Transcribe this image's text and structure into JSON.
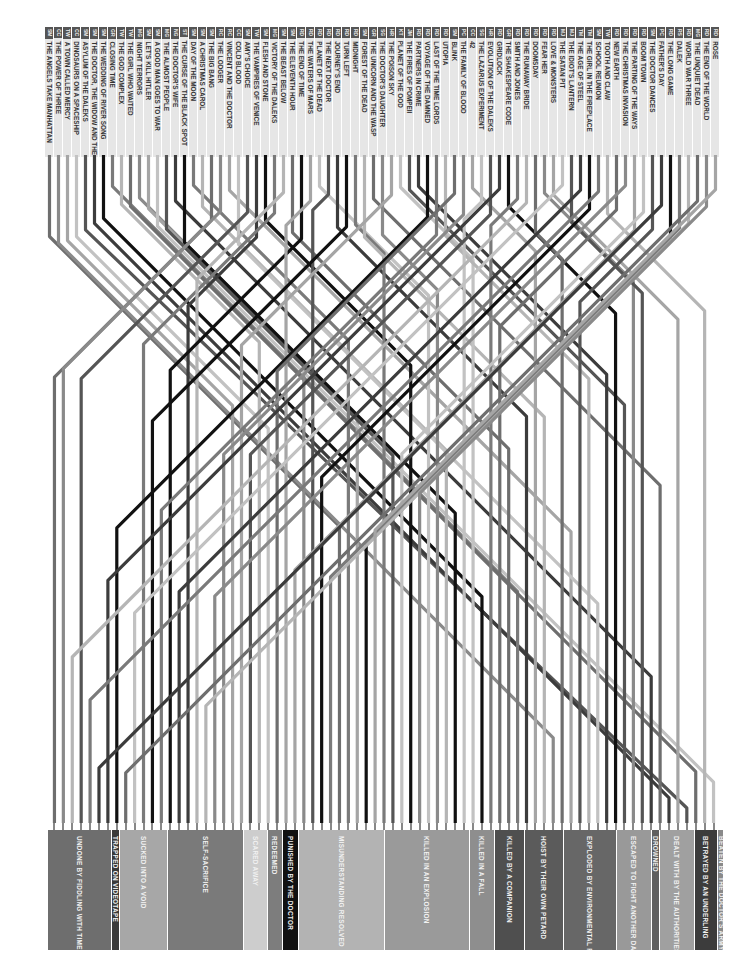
{
  "episodes": [
    {
      "code": "SM",
      "title": "THE ANGELS TAKE MANHATTAN"
    },
    {
      "code": "CC",
      "title": "THE POWER OF THREE"
    },
    {
      "code": "TW",
      "title": "A TOWN CALLED MERCY"
    },
    {
      "code": "CC",
      "title": "DINOSAURS ON A SPACESHIP"
    },
    {
      "code": "SM",
      "title": "ASYLUM OF THE DALEKS"
    },
    {
      "code": "SM",
      "title": "THE DOCTOR, THE WIDOW AND THE WARDROBE"
    },
    {
      "code": "SM",
      "title": "THE WEDDING OF RIVER SONG"
    },
    {
      "code": "GR",
      "title": "CLOSING TIME"
    },
    {
      "code": "TW",
      "title": "THE GOD COMPLEX"
    },
    {
      "code": "TW",
      "title": "THE GIRL WHO WAITED"
    },
    {
      "code": "MG",
      "title": "NIGHT TERRORS"
    },
    {
      "code": "SM",
      "title": "LET'S KILL HITLER"
    },
    {
      "code": "SM",
      "title": "A GOOD MAN GOES TO WAR"
    },
    {
      "code": "MG",
      "title": "THE ALMOST PEOPLE"
    },
    {
      "code": "NG",
      "title": "THE DOCTOR'S WIFE"
    },
    {
      "code": "ST",
      "title": "THE CURSE OF THE BLACK SPOT"
    },
    {
      "code": "SM",
      "title": "DAY OF THE MOON"
    },
    {
      "code": "SM",
      "title": "A CHRISTMAS CAROL"
    },
    {
      "code": "SM",
      "title": "THE BIG BANG"
    },
    {
      "code": "RC",
      "title": "THE LODGER"
    },
    {
      "code": "RC",
      "title": "VINCENT AND THE DOCTOR"
    },
    {
      "code": "CC",
      "title": "COLD BLOOD"
    },
    {
      "code": "SM",
      "title": "AMY'S CHOICE"
    },
    {
      "code": "TW",
      "title": "THE VAMPIRES OF VENICE"
    },
    {
      "code": "SM",
      "title": "FLESH AND STONE"
    },
    {
      "code": "MG",
      "title": "VICTORY OF THE DALEKS"
    },
    {
      "code": "SM",
      "title": "THE BEAST BELOW"
    },
    {
      "code": "SM",
      "title": "THE ELEVENTH HOUR"
    },
    {
      "code": "RD",
      "title": "THE END OF TIME"
    },
    {
      "code": "RD",
      "title": "THE WATERS OF MARS"
    },
    {
      "code": "RD",
      "title": "PLANET OF THE DEAD"
    },
    {
      "code": "RD",
      "title": "THE NEXT DOCTOR"
    },
    {
      "code": "RD",
      "title": "JOURNEY'S END"
    },
    {
      "code": "RD",
      "title": "TURN LEFT"
    },
    {
      "code": "RD",
      "title": "MIDNIGHT"
    },
    {
      "code": "SM",
      "title": "FOREST OF THE DEAD"
    },
    {
      "code": "GR",
      "title": "THE UNICORN AND THE WASP"
    },
    {
      "code": "SG",
      "title": "THE DOCTOR'S DAUGHTER"
    },
    {
      "code": "HR",
      "title": "THE POISON SKY"
    },
    {
      "code": "KT",
      "title": "PLANET OF THE OOD"
    },
    {
      "code": "JM",
      "title": "THE FIRES OF POMPEII"
    },
    {
      "code": "RD",
      "title": "PARTNERS IN CRIME"
    },
    {
      "code": "RD",
      "title": "VOYAGE OF THE DAMNED"
    },
    {
      "code": "RD",
      "title": "LAST OF THE TIME LORDS"
    },
    {
      "code": "RD",
      "title": "UTOPIA"
    },
    {
      "code": "SM",
      "title": "BLINK"
    },
    {
      "code": "PC",
      "title": "THE FAMILY OF BLOOD"
    },
    {
      "code": "CC",
      "title": "42"
    },
    {
      "code": "SG",
      "title": "THE LAZARUS EXPERIMENT"
    },
    {
      "code": "HR",
      "title": "EVOLUTION OF THE DALEKS"
    },
    {
      "code": "RD",
      "title": "GRIDLOCK"
    },
    {
      "code": "GR",
      "title": "THE SHAKESPEARE CODE"
    },
    {
      "code": "RD",
      "title": "SMITH AND JONES"
    },
    {
      "code": "RD",
      "title": "THE RUNAWAY BRIDE"
    },
    {
      "code": "RD",
      "title": "DOOMSDAY"
    },
    {
      "code": "RD",
      "title": "FEAR HER"
    },
    {
      "code": "RD",
      "title": "LOVE & MONSTERS"
    },
    {
      "code": "MJ",
      "title": "THE SATAN PIT"
    },
    {
      "code": "MJ",
      "title": "THE IDIOT'S LANTERN"
    },
    {
      "code": "TM",
      "title": "THE AGE OF STEEL"
    },
    {
      "code": "TM",
      "title": "THE GIRL IN THE FIREPLACE"
    },
    {
      "code": "SM",
      "title": "SCHOOL REUNION"
    },
    {
      "code": "TW",
      "title": "TOOTH AND CLAW"
    },
    {
      "code": "RD",
      "title": "NEW EARTH"
    },
    {
      "code": "RD",
      "title": "THE CHRISTMAS INVASION"
    },
    {
      "code": "RD",
      "title": "THE PARTING OF THE WAYS"
    },
    {
      "code": "RD",
      "title": "BOOM TOWN"
    },
    {
      "code": "SM",
      "title": "THE DOCTOR DANCES"
    },
    {
      "code": "PC",
      "title": "FATHER'S DAY"
    },
    {
      "code": "RD",
      "title": "THE LONG GAME"
    },
    {
      "code": "RS",
      "title": "DALEK"
    },
    {
      "code": "RD",
      "title": "WORLD WAR THREE"
    },
    {
      "code": "MG",
      "title": "THE UNQUIET DEAD"
    },
    {
      "code": "RD",
      "title": "THE END OF THE WORLD"
    },
    {
      "code": "RD",
      "title": "ROSE"
    }
  ],
  "categories": [
    {
      "label": "UNDONE BY FIDDLING WITH TIME",
      "x": 48,
      "w": 64,
      "color": "#6e6e6e"
    },
    {
      "label": "TRAPPED ON VIDEOTAPE",
      "x": 112,
      "w": 8,
      "color": "#3a3a3a"
    },
    {
      "label": "SUCKED INTO A VOID",
      "x": 120,
      "w": 48,
      "color": "#a7a7a7"
    },
    {
      "label": "SELF-SACRIFICE",
      "x": 168,
      "w": 76,
      "color": "#7a7a7a"
    },
    {
      "label": "SCARED AWAY",
      "x": 244,
      "w": 24,
      "color": "#cdcdcd"
    },
    {
      "label": "REDEEMED",
      "x": 268,
      "w": 15,
      "color": "#7d7d7d"
    },
    {
      "label": "PUNISHED BY THE DOCTOR",
      "x": 283,
      "w": 16,
      "color": "#111111"
    },
    {
      "label": "MISUNDERSTANDING RESOLVED",
      "x": 299,
      "w": 86,
      "color": "#b3b3b3"
    },
    {
      "label": "KILLED IN AN EXPLOSION",
      "x": 385,
      "w": 85,
      "color": "#9a9a9a"
    },
    {
      "label": "KILLED IN A FALL",
      "x": 470,
      "w": 25,
      "color": "#8e8e8e"
    },
    {
      "label": "KILLED BY A COMPANION",
      "x": 495,
      "w": 30,
      "color": "#4f4f4f"
    },
    {
      "label": "HOIST BY THEIR OWN PETARD",
      "x": 525,
      "w": 39,
      "color": "#5b5b5b"
    },
    {
      "label": "EXPLODED BY ENVIRONMENTAL FACTOR",
      "x": 564,
      "w": 53,
      "color": "#676767"
    },
    {
      "label": "ESCAPED TO FIGHT ANOTHER DAY",
      "x": 617,
      "w": 35,
      "color": "#999999"
    },
    {
      "label": "DROWNED",
      "x": 652,
      "w": 8,
      "color": "#5f5f5f"
    },
    {
      "label": "DEALT WITH BY THE AUTHORITIES",
      "x": 660,
      "w": 35,
      "color": "#a0a0a0"
    },
    {
      "label": "BETRAYED BY AN UNDERLING",
      "x": 695,
      "w": 23,
      "color": "#3c3c3c"
    },
    {
      "label": "BEATEN BY THE DOCTOR'S ARMY",
      "x": 718,
      "w": 6,
      "color": "#8a8a8a"
    }
  ],
  "palette": [
    "#6e6e6e",
    "#8a8a8a",
    "#a5a5a5",
    "#c2c2c2",
    "#555555",
    "#3c3c3c",
    "#111111",
    "#7a7a7a",
    "#b5b5b5"
  ]
}
